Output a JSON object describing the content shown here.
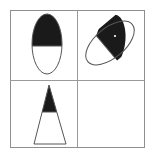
{
  "figure": {
    "width": 153,
    "height": 163,
    "background_color": "#ffffff",
    "fill_color": "#1a1a1a",
    "outline_color": "#555555",
    "grid_line_color": "#9a9a9a",
    "grid_border_color": "#8f8f8f"
  },
  "grid": {
    "rows": 2,
    "columns": 2,
    "x": 10,
    "y": 10,
    "width": 134,
    "height": 137,
    "mid_x": 77,
    "mid_y": 80,
    "border_width": 1,
    "divider_width": 1
  },
  "cells": [
    {
      "name": "cell-top-left",
      "row": 0,
      "column": 0,
      "shape": "ellipse",
      "filled": true,
      "fill_fraction": 0.57,
      "fill_region": "top",
      "rotation_deg": 0,
      "center_x": 47,
      "center_y": 44,
      "radius_x": 15,
      "radius_y": 30,
      "fill_boundary_y": 46
    },
    {
      "name": "cell-top-right",
      "row": 0,
      "column": 1,
      "shape": "ellipse",
      "filled": true,
      "fill_fraction": 0.6,
      "fill_region": "upper-right",
      "rotation_deg": -40,
      "center_x": 110,
      "center_y": 43,
      "radius_x": 29,
      "radius_y": 15,
      "speck_x": 115,
      "speck_y": 36
    },
    {
      "name": "cell-bottom-left",
      "row": 1,
      "column": 0,
      "shape": "triangle",
      "filled": true,
      "fill_fraction": 0.46,
      "fill_region": "top",
      "rotation_deg": 0,
      "apex_x": 49,
      "apex_y": 85,
      "base_left_x": 34,
      "base_right_x": 66,
      "base_y": 144,
      "fill_boundary_y": 112
    },
    {
      "name": "cell-bottom-right",
      "row": 1,
      "column": 1,
      "shape": "none",
      "filled": false,
      "fill_fraction": 0,
      "fill_region": "none",
      "rotation_deg": 0
    }
  ]
}
